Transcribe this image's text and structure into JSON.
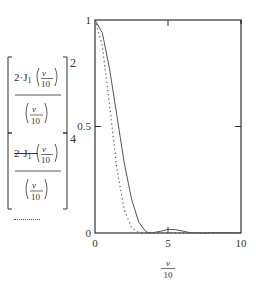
{
  "chart_data": {
    "type": "line",
    "title": "",
    "xlabel": "v/10",
    "ylabel": "",
    "xlim": [
      0,
      10
    ],
    "ylim": [
      0,
      1
    ],
    "grid": false,
    "legend_position": "left",
    "x_ticks": [
      "0",
      "5",
      "10"
    ],
    "y_ticks": [
      "0",
      "0.5",
      "1"
    ],
    "series": [
      {
        "name": "[2·J1(v/10) / (v/10)]^2",
        "style": "solid",
        "x": [
          0,
          0.5,
          1.0,
          1.5,
          2.0,
          2.5,
          3.0,
          3.5,
          3.83,
          4.5,
          5.0,
          5.5,
          6.0,
          6.5,
          7.0,
          7.5,
          8.0,
          9.0,
          10.0
        ],
        "values": [
          1.0,
          0.94,
          0.77,
          0.55,
          0.33,
          0.16,
          0.05,
          0.005,
          0.0,
          0.008,
          0.017,
          0.016,
          0.009,
          0.002,
          0.0,
          0.0,
          0.002,
          0.002,
          0.0
        ]
      },
      {
        "name": "[2·J1(v/10) / (v/10)]^4",
        "style": "dotted",
        "x": [
          0,
          0.5,
          1.0,
          1.5,
          2.0,
          2.5,
          3.0,
          3.5,
          3.83,
          5.0,
          10.0
        ],
        "values": [
          1.0,
          0.88,
          0.6,
          0.3,
          0.11,
          0.026,
          0.002,
          0.0,
          0.0,
          0.0003,
          0.0
        ]
      }
    ]
  },
  "axes": {
    "y_tick_labels": [
      "1",
      "0.5",
      "0"
    ],
    "x_tick_labels": [
      "0",
      "5",
      "10"
    ],
    "x_axis_label_numerator": "v",
    "x_axis_label_denominator": "10"
  },
  "legend": {
    "items": [
      {
        "prefix": "2·J",
        "subscript": "1",
        "arg_num": "v",
        "arg_den": "10",
        "den_num": "v",
        "den_den": "10",
        "power": "2",
        "line_style": "solid"
      },
      {
        "prefix": "2·J",
        "subscript": "1",
        "arg_num": "v",
        "arg_den": "10",
        "den_num": "v",
        "den_den": "10",
        "power": "4",
        "line_style": "dotted"
      }
    ]
  },
  "colors": {
    "line": "#555555",
    "frame": "#333333",
    "background": "#ffffff"
  }
}
